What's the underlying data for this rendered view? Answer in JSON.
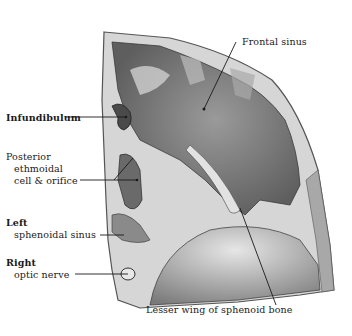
{
  "figure": {
    "labels": {
      "frontal_sinus": "Frontal sinus",
      "infundibulum": "Infundibulum",
      "posterior_ethmoidal_l1": "Posterior",
      "posterior_ethmoidal_l2": "ethmoidal",
      "posterior_ethmoidal_l3": "cell & orifice",
      "left_sphenoidal_l1": "Left",
      "left_sphenoidal_l2": "sphenoidal sinus",
      "right_optic_l1": "Right",
      "right_optic_l2": "optic nerve",
      "lesser_wing": "Lesser wing of sphenoid bone"
    },
    "colors": {
      "background": "#ffffff",
      "bone": "#d9d9d9",
      "cavity_dark": "#6e6e6e",
      "cavity_mid": "#8c8c8c",
      "leader_line": "#1a1a1a"
    }
  }
}
